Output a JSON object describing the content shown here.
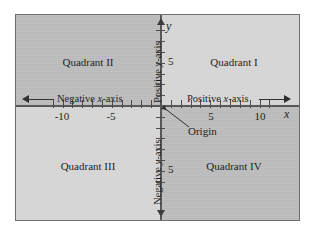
{
  "figure": {
    "type": "cartesian-coordinate-plane",
    "frame_border_color": "#6e6e6e",
    "background_color": "#d2d2d2"
  },
  "colors": {
    "quadrant_dark": "#bcbcbc",
    "quadrant_light": "#d6d6d6",
    "axis": "#555555",
    "tick": "#4a4a4a",
    "text": "#1a1a1a",
    "arrow": "#2b2b2b"
  },
  "axes": {
    "x_letter": "x",
    "y_letter": "y",
    "x_tick_labels": [
      "-10",
      "-5",
      "5",
      "10"
    ],
    "y_tick_labels_above": "5",
    "y_tick_labels_below": "5"
  },
  "direction_labels": {
    "negative_x_prefix": "Negative ",
    "negative_x_italic": "x",
    "negative_x_suffix": "-axis",
    "positive_x_prefix": "Positive ",
    "positive_x_italic": "x",
    "positive_x_suffix": "-axis",
    "positive_y_prefix": "Positive ",
    "positive_y_italic": "y",
    "positive_y_suffix": "-axis",
    "negative_y_prefix": "Negative ",
    "negative_y_italic": "y",
    "negative_y_suffix": "-axis"
  },
  "quadrants": {
    "q1": "Quadrant I",
    "q2": "Quadrant II",
    "q3": "Quadrant III",
    "q4": "Quadrant IV"
  },
  "origin": {
    "label": "Origin"
  },
  "chart_data": {
    "type": "scatter",
    "title": "",
    "xlabel": "x",
    "ylabel": "y",
    "xlim": [
      -12,
      12
    ],
    "ylim": [
      -9,
      9
    ],
    "x_ticks": [
      -11,
      -10,
      -9,
      -8,
      -7,
      -6,
      -5,
      -4,
      -3,
      -2,
      -1,
      1,
      2,
      3,
      4,
      5,
      6,
      7,
      8,
      9,
      10,
      11
    ],
    "x_tick_labeled": [
      -10,
      -5,
      5,
      10
    ],
    "y_ticks": [
      -7,
      -6,
      -5,
      -4,
      -3,
      -2,
      -1,
      1,
      2,
      3,
      4,
      5,
      6,
      7
    ],
    "y_tick_labeled": [
      5,
      -5
    ],
    "grid": false,
    "legend": "none",
    "series": [],
    "annotations": [
      {
        "text": "Quadrant I",
        "x": 6.5,
        "y": 4.5
      },
      {
        "text": "Quadrant II",
        "x": -6.5,
        "y": 4.5
      },
      {
        "text": "Quadrant III",
        "x": -6.5,
        "y": -4.5
      },
      {
        "text": "Quadrant IV",
        "x": 6.5,
        "y": -4.5
      },
      {
        "text": "Origin",
        "x": 2.4,
        "y": -1.8
      },
      {
        "text": "Negative x-axis",
        "x": -8.5,
        "y": 1.1
      },
      {
        "text": "Positive x-axis",
        "x": 2.5,
        "y": 1.1
      },
      {
        "text": "Positive y-axis",
        "x": -0.75,
        "y": 3.0
      },
      {
        "text": "Negative y-axis",
        "x": -0.75,
        "y": -4.0
      }
    ]
  }
}
